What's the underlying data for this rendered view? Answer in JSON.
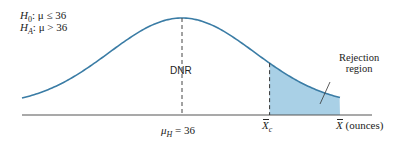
{
  "hypotheses": {
    "null": {
      "symbol": "H",
      "sub": "0",
      "text": ": μ ≤ 36"
    },
    "alt": {
      "symbol": "H",
      "sub": "A",
      "text": ": μ > 36"
    }
  },
  "labels": {
    "dnr": "DNR",
    "rejection": [
      "Rejection",
      "region"
    ],
    "mean": {
      "symbol": "μ",
      "sub": "H",
      "text": " = 36"
    },
    "critical": {
      "symbol": "X",
      "sub": "c"
    },
    "axis": {
      "symbol": "X",
      "text": " (ounces)"
    }
  },
  "colors": {
    "curve": "#3a7ca5",
    "shade": "#a9d0e6",
    "axis": "#555555"
  },
  "distribution": {
    "type": "normal",
    "mean": 36,
    "critical_z": 1.2,
    "tail": "right"
  }
}
